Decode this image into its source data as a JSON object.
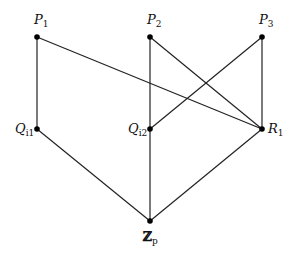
{
  "diagram": {
    "type": "hasse-diagram",
    "nodes": [
      {
        "id": "P1",
        "base": "P",
        "sub": "1",
        "x": 37,
        "y": 37,
        "label_pos": "above"
      },
      {
        "id": "P2",
        "base": "P",
        "sub": "2",
        "x": 150,
        "y": 37,
        "label_pos": "above"
      },
      {
        "id": "P3",
        "base": "P",
        "sub": "3",
        "x": 262,
        "y": 37,
        "label_pos": "above"
      },
      {
        "id": "Q11",
        "base": "Q",
        "sub": "i1",
        "x": 37,
        "y": 129,
        "label_pos": "left"
      },
      {
        "id": "Q12",
        "base": "Q",
        "sub": "i2",
        "x": 150,
        "y": 129,
        "label_pos": "left"
      },
      {
        "id": "R1",
        "base": "R",
        "sub": "1",
        "x": 262,
        "y": 129,
        "label_pos": "right"
      },
      {
        "id": "Zp",
        "base": "ℤ",
        "sub": "p",
        "x": 150,
        "y": 221,
        "label_pos": "below"
      }
    ],
    "edges": [
      [
        "P1",
        "Q11"
      ],
      [
        "P1",
        "R1"
      ],
      [
        "P2",
        "Q12"
      ],
      [
        "P2",
        "R1"
      ],
      [
        "P3",
        "Q12"
      ],
      [
        "P3",
        "R1"
      ],
      [
        "Q11",
        "Zp"
      ],
      [
        "Q12",
        "Zp"
      ],
      [
        "R1",
        "Zp"
      ]
    ],
    "colors": {
      "line": "#222222",
      "node": "#000000"
    }
  }
}
